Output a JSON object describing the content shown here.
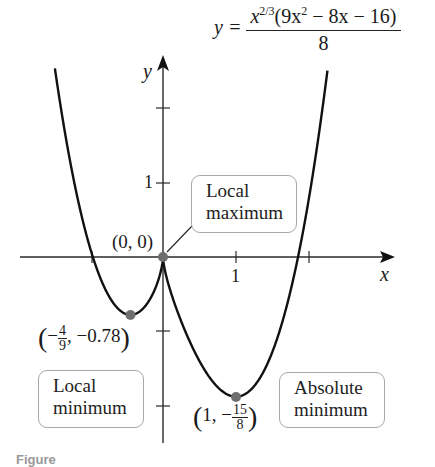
{
  "equation": {
    "lhs": "y =",
    "numerator_base": "x",
    "numerator_exp": "2/3",
    "numerator_rest": "(9x",
    "numerator_sq": "2",
    "numerator_tail": " − 8x − 16)",
    "denominator": "8"
  },
  "axes": {
    "x_label": "x",
    "y_label": "y",
    "x_tick_label": "1",
    "y_tick_label": "1"
  },
  "annotations": {
    "origin_label": "(0, 0)",
    "local_max_box": [
      "Local",
      "maximum"
    ],
    "local_min_box": [
      "Local",
      "minimum"
    ],
    "abs_min_box": [
      "Absolute",
      "minimum"
    ],
    "local_min_point": {
      "open": "(",
      "sign": "−",
      "num": "4",
      "den": "9",
      "rest": ", −0.78",
      "close": ")"
    },
    "abs_min_point": {
      "open": "(",
      "lead": "1, −",
      "num": "15",
      "den": "8",
      "close": ")"
    }
  },
  "caption": "Figure",
  "colors": {
    "curve": "#111111",
    "axis": "#2a2a2a",
    "point": "#6e6e6e",
    "box_border": "#a8a8a8"
  },
  "chart_data": {
    "type": "line",
    "xlabel": "x",
    "ylabel": "y",
    "function": "y = x^(2/3) * (9x^2 - 8x - 16) / 8",
    "xlim": [
      -2.2,
      3.7
    ],
    "ylim": [
      -2.5,
      2.7
    ],
    "x_ticks": [
      -1,
      1,
      2
    ],
    "x_tick_labels": {
      "1": "1"
    },
    "y_ticks": [
      -2,
      -1,
      1
    ],
    "y_tick_labels": {
      "1": "1"
    },
    "grid": false,
    "sampled_points": [
      {
        "x": -1.45,
        "y": 2.5
      },
      {
        "x": -1.0,
        "y": 0.125
      },
      {
        "x": -0.75,
        "y": -0.54
      },
      {
        "x": -0.444,
        "y": -0.78
      },
      {
        "x": -0.2,
        "y": -0.6
      },
      {
        "x": 0.0,
        "y": 0.0
      },
      {
        "x": 0.25,
        "y": -0.99
      },
      {
        "x": 0.5,
        "y": -1.57
      },
      {
        "x": 1.0,
        "y": -1.875
      },
      {
        "x": 1.5,
        "y": -1.21
      },
      {
        "x": 1.87,
        "y": 0.0
      },
      {
        "x": 2.0,
        "y": 0.79
      },
      {
        "x": 2.25,
        "y": 2.5
      }
    ],
    "marked_points": [
      {
        "x": 0,
        "y": 0,
        "label": "(0, 0)",
        "annotation": "Local maximum"
      },
      {
        "x": -0.444,
        "y": -0.78,
        "label": "(-4/9, -0.78)",
        "annotation": "Local minimum"
      },
      {
        "x": 1,
        "y": -1.875,
        "label": "(1, -15/8)",
        "annotation": "Absolute minimum"
      }
    ]
  }
}
